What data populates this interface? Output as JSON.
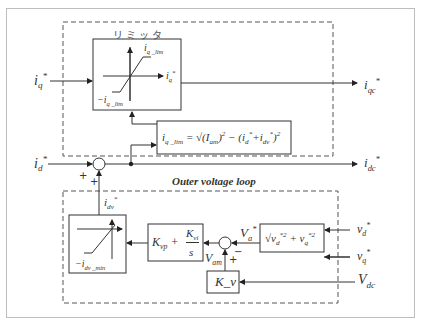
{
  "diagram": {
    "limiter_title": "リミッタ",
    "outer_loop_title": "Outer voltage loop",
    "inputs": {
      "iq_ref": "i_q*",
      "id_ref": "i_d*",
      "vd_ref": "v_d*",
      "vq_ref": "v_q*",
      "vdc": "V_dc"
    },
    "outputs": {
      "iqc_ref": "i_qc*",
      "idc_ref": "i_dc*"
    },
    "limiter_block": {
      "upper": "i_q_lim",
      "lower": "−i_q_lim",
      "out_axis": "i_q*"
    },
    "iq_lim_block": {
      "formula": "i_q_lim = √((I_am)² − (i_d* + i_dv*)²)"
    },
    "dv_limiter_block": {
      "lower": "−i_dv_min",
      "output": "i_dv*"
    },
    "pi_block": {
      "formula": "K_vp + K_vi / s"
    },
    "magnitude_block": {
      "formula": "√(v_d*² + v_q*²)"
    },
    "gain_block": {
      "label": "K_v"
    },
    "signals": {
      "va_ref": "V_a*",
      "vam": "V_am"
    },
    "sum_signs": {
      "top_junction": [
        "+",
        "+"
      ],
      "bottom_junction": [
        "+",
        "−"
      ]
    }
  }
}
